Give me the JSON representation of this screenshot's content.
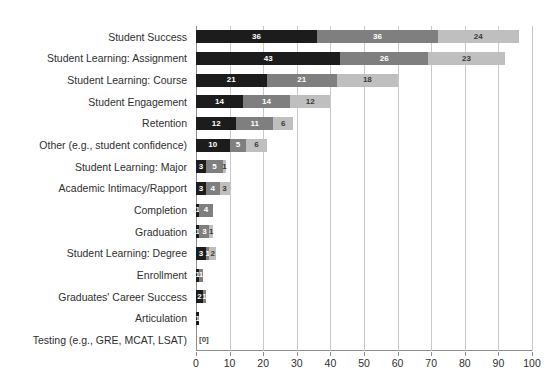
{
  "chart_data": {
    "type": "bar",
    "orientation": "horizontal",
    "stacked": true,
    "title": "",
    "xlabel": "",
    "ylabel": "",
    "xlim": [
      0,
      100
    ],
    "xticks": [
      0,
      10,
      20,
      30,
      40,
      50,
      60,
      70,
      80,
      90,
      100
    ],
    "grid": true,
    "legend": "none",
    "categories": [
      "Student Success",
      "Student Learning: Assignment",
      "Student Learning: Course",
      "Student Engagement",
      "Retention",
      "Other (e.g., student confidence)",
      "Student Learning: Major",
      "Academic Intimacy/Rapport",
      "Completion",
      "Graduation",
      "Student Learning: Degree",
      "Enrollment",
      "Graduates' Career Success",
      "Articulation",
      "Testing (e.g., GRE, MCAT, LSAT)"
    ],
    "series": [
      {
        "name": "Series 1",
        "color": "#1c1c1c",
        "values": [
          36,
          43,
          21,
          14,
          12,
          10,
          3,
          3,
          1,
          1,
          3,
          1,
          2,
          1,
          0
        ],
        "labels": [
          "36",
          "43",
          "21",
          "14",
          "12",
          "10",
          "3",
          "3",
          "1",
          "1",
          "3",
          "1",
          "2",
          "1",
          ""
        ]
      },
      {
        "name": "Series 2",
        "color": "#7f7f7f",
        "values": [
          36,
          26,
          21,
          14,
          11,
          5,
          5,
          4,
          4,
          3,
          1,
          1,
          1,
          0,
          0
        ],
        "labels": [
          "36",
          "26",
          "21",
          "14",
          "11",
          "5",
          "5",
          "4",
          "4",
          "3",
          "1",
          "1",
          "1",
          "",
          ""
        ]
      },
      {
        "name": "Series 3",
        "color": "#bfbfbf",
        "values": [
          24,
          23,
          18,
          12,
          6,
          6,
          1,
          3,
          0,
          1,
          2,
          0,
          0,
          0,
          0
        ],
        "labels": [
          "24",
          "23",
          "18",
          "12",
          "6",
          "6",
          "1",
          "3",
          "",
          "1",
          "2",
          "",
          "",
          "",
          ""
        ]
      }
    ],
    "zero_annotations": [
      {
        "category": "Testing (e.g., GRE, MCAT, LSAT)",
        "label": "[0]"
      }
    ]
  }
}
